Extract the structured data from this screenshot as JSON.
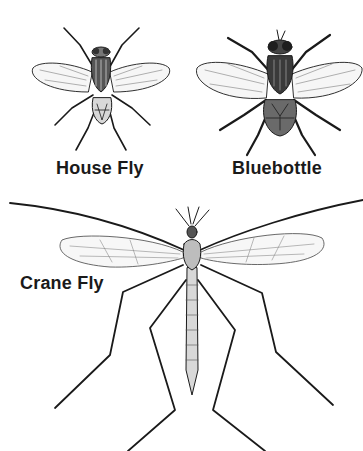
{
  "figure": {
    "specimens": [
      {
        "id": "house-fly",
        "label": "House Fly"
      },
      {
        "id": "bluebottle",
        "label": "Bluebottle"
      },
      {
        "id": "crane-fly",
        "label": "Crane Fly"
      }
    ],
    "colors": {
      "ink": "#1a1a1a",
      "wing": "#f4f4f4",
      "background": "#ffffff"
    }
  }
}
